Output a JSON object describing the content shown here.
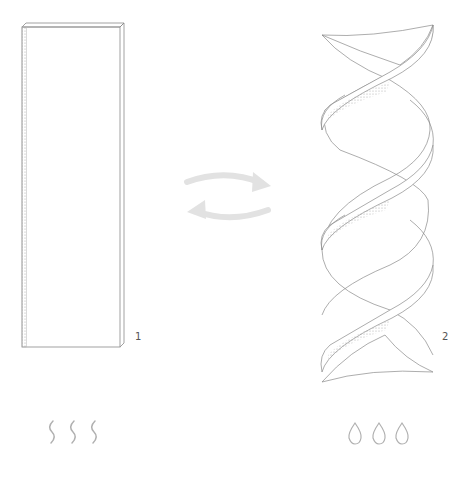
{
  "diagram": {
    "items": [
      {
        "id": "flat-plank",
        "label": "1",
        "state": "flat"
      },
      {
        "id": "twisted-helix",
        "label": "2",
        "state": "twisted"
      }
    ],
    "transition": {
      "type": "bidirectional-arrows"
    },
    "conditions": [
      {
        "id": "heat",
        "icon": "heat-wave-icon",
        "count": 3,
        "under": "1"
      },
      {
        "id": "water",
        "icon": "water-drop-icon",
        "count": 3,
        "under": "2"
      }
    ]
  },
  "colors": {
    "line": "#8a8a8a",
    "arrow": "#e2e2e2",
    "stipple": "#9a9a9a",
    "label": "#555555"
  }
}
